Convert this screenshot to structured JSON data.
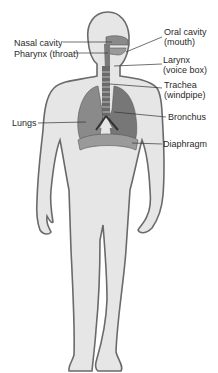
{
  "diagram": {
    "labels": {
      "nasal_cavity": "Nasal cavity",
      "pharynx": "Pharynx (throat)",
      "oral_cavity_line1": "Oral cavity",
      "oral_cavity_line2": "(mouth)",
      "larynx_line1": "Larynx",
      "larynx_line2": "(voice box)",
      "trachea_line1": "Trachea",
      "trachea_line2": "(windpipe)",
      "bronchus": "Bronchus",
      "lungs": "Lungs",
      "diaphragm": "Diaphragm"
    },
    "colors": {
      "body_fill": "#e6e6e6",
      "body_outline": "#6a6a6a",
      "organ_fill": "#8a8a8a",
      "organ_dark": "#555555",
      "leader_line": "#333333",
      "text": "#2a2a2a"
    }
  }
}
